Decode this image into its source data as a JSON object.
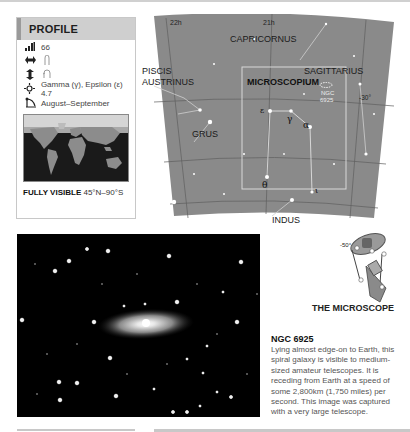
{
  "profile": {
    "title": "PROFILE",
    "rows": [
      {
        "icon": "size-bars-icon",
        "glyph": "▂▃▅",
        "text": "66"
      },
      {
        "icon": "width-arrows-icon",
        "glyph": "⇔",
        "text": "hand-span-icon"
      },
      {
        "icon": "height-arrows-icon",
        "glyph": "⇕",
        "text": "hand-fist-icon"
      },
      {
        "icon": "brightest-star-icon",
        "glyph": "✦",
        "text": "Gamma (γ), Epsilon (ε) 4.7"
      },
      {
        "icon": "season-icon",
        "glyph": "◣",
        "text": "August–September"
      }
    ],
    "visibility_label": "FULLY VISIBLE",
    "visibility_range": "45°N–90°S"
  },
  "chart": {
    "ra_labels": [
      "22h",
      "21h"
    ],
    "dec_labels": [
      "-30°",
      "-50°"
    ],
    "constellations": [
      "CAPRICORNUS",
      "SAGITTARIUS",
      "PISCIS",
      "AUSTRINUS",
      "MICROSCOPIUM",
      "GRUS",
      "INDUS"
    ],
    "stars": [
      "ε",
      "γ",
      "α",
      "θ",
      "ι"
    ],
    "object_label_1": "NGC",
    "object_label_2": "6925"
  },
  "illustration": {
    "caption": "THE MICROSCOPE"
  },
  "article": {
    "title": "NGC 6925",
    "body": "Lying almost edge-on to Earth, this spiral galaxy is visible to medium-sized amateur telescopes. It is receding from Earth at a speed of some 2,800km (1,750 miles) per second. This image was captured with a very large telescope."
  },
  "colors": {
    "chart_bg": "#8a8a8a",
    "profile_header": "#cfcfcf",
    "photo_bg": "#000000"
  }
}
